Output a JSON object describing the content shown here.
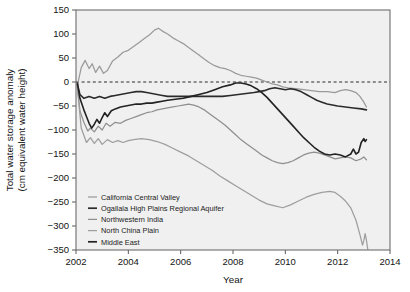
{
  "chart_data": {
    "type": "line",
    "title": "",
    "xlabel": "Year",
    "ylabel": "Total water storage anomaly\n(cm equivalent water height)",
    "ylabel_line1": "Total water storage anomaly",
    "ylabel_line2": "(cm equivalent water height)",
    "xlim": [
      2002,
      2014
    ],
    "ylim": [
      -350,
      150
    ],
    "xticks": [
      2002,
      2004,
      2006,
      2008,
      2010,
      2012,
      2014
    ],
    "yticks": [
      150,
      100,
      50,
      0,
      -50,
      -100,
      -150,
      -200,
      -250,
      -300,
      -350
    ],
    "xtick_labels": [
      "2002",
      "2004",
      "2006",
      "2008",
      "2010",
      "2012",
      "2014"
    ],
    "ytick_labels": [
      "150",
      "100",
      "50",
      "0",
      "-50",
      "-100",
      "-150",
      "-200",
      "-250",
      "-300",
      "-350"
    ],
    "grid": false,
    "plot_background": "#f0f0f0",
    "reference_line": {
      "value": 0,
      "style": "dashed",
      "color": "#2a2a2a"
    },
    "legend_position": "lower-left-inside",
    "series": [
      {
        "name": "California Central Valley",
        "color": "#9a9a9a",
        "width": 1.25,
        "points": [
          [
            2002.05,
            -8
          ],
          [
            2002.2,
            30
          ],
          [
            2002.35,
            45
          ],
          [
            2002.5,
            28
          ],
          [
            2002.62,
            38
          ],
          [
            2002.75,
            20
          ],
          [
            2002.9,
            33
          ],
          [
            2003.05,
            18
          ],
          [
            2003.2,
            24
          ],
          [
            2003.4,
            44
          ],
          [
            2003.6,
            52
          ],
          [
            2003.8,
            62
          ],
          [
            2004.0,
            66
          ],
          [
            2004.2,
            74
          ],
          [
            2004.4,
            82
          ],
          [
            2004.6,
            90
          ],
          [
            2004.8,
            98
          ],
          [
            2005.0,
            108
          ],
          [
            2005.15,
            112
          ],
          [
            2005.3,
            106
          ],
          [
            2005.5,
            100
          ],
          [
            2005.7,
            92
          ],
          [
            2005.9,
            86
          ],
          [
            2006.1,
            80
          ],
          [
            2006.3,
            72
          ],
          [
            2006.5,
            64
          ],
          [
            2006.7,
            56
          ],
          [
            2006.9,
            48
          ],
          [
            2007.1,
            40
          ],
          [
            2007.3,
            34
          ],
          [
            2007.5,
            30
          ],
          [
            2007.7,
            28
          ],
          [
            2007.9,
            24
          ],
          [
            2008.1,
            18
          ],
          [
            2008.3,
            14
          ],
          [
            2008.5,
            12
          ],
          [
            2008.7,
            10
          ],
          [
            2008.9,
            8
          ],
          [
            2009.1,
            4
          ],
          [
            2009.3,
            0
          ],
          [
            2009.5,
            -4
          ],
          [
            2009.7,
            -6
          ],
          [
            2009.9,
            -10
          ],
          [
            2010.1,
            -12
          ],
          [
            2010.4,
            -14
          ],
          [
            2010.7,
            -16
          ],
          [
            2011.0,
            -18
          ],
          [
            2011.3,
            -20
          ],
          [
            2011.6,
            -20
          ],
          [
            2011.9,
            -22
          ],
          [
            2012.1,
            -18
          ],
          [
            2012.3,
            -16
          ],
          [
            2012.5,
            -18
          ],
          [
            2012.7,
            -22
          ],
          [
            2012.85,
            -30
          ],
          [
            2013.0,
            -42
          ],
          [
            2013.1,
            -52
          ]
        ]
      },
      {
        "name": "Ogallala High Plains Regional Aquifer",
        "color": "#2b2b2b",
        "width": 1.6,
        "points": [
          [
            2002.05,
            -4
          ],
          [
            2002.15,
            -26
          ],
          [
            2002.3,
            -34
          ],
          [
            2002.5,
            -30
          ],
          [
            2002.7,
            -34
          ],
          [
            2002.9,
            -30
          ],
          [
            2003.1,
            -34
          ],
          [
            2003.3,
            -30
          ],
          [
            2003.5,
            -28
          ],
          [
            2003.7,
            -26
          ],
          [
            2003.9,
            -24
          ],
          [
            2004.1,
            -22
          ],
          [
            2004.3,
            -20
          ],
          [
            2004.5,
            -20
          ],
          [
            2004.7,
            -22
          ],
          [
            2004.9,
            -24
          ],
          [
            2005.1,
            -26
          ],
          [
            2005.3,
            -28
          ],
          [
            2005.5,
            -30
          ],
          [
            2005.8,
            -30
          ],
          [
            2006.1,
            -30
          ],
          [
            2006.4,
            -30
          ],
          [
            2006.7,
            -30
          ],
          [
            2007.0,
            -30
          ],
          [
            2007.3,
            -30
          ],
          [
            2007.6,
            -30
          ],
          [
            2007.9,
            -28
          ],
          [
            2008.2,
            -26
          ],
          [
            2008.5,
            -24
          ],
          [
            2008.8,
            -22
          ],
          [
            2009.0,
            -20
          ],
          [
            2009.2,
            -18
          ],
          [
            2009.4,
            -14
          ],
          [
            2009.6,
            -12
          ],
          [
            2009.8,
            -14
          ],
          [
            2010.0,
            -16
          ],
          [
            2010.2,
            -14
          ],
          [
            2010.4,
            -16
          ],
          [
            2010.6,
            -20
          ],
          [
            2010.8,
            -26
          ],
          [
            2011.0,
            -32
          ],
          [
            2011.2,
            -38
          ],
          [
            2011.4,
            -42
          ],
          [
            2011.6,
            -46
          ],
          [
            2011.8,
            -48
          ],
          [
            2012.0,
            -50
          ],
          [
            2012.3,
            -52
          ],
          [
            2012.6,
            -54
          ],
          [
            2012.9,
            -56
          ],
          [
            2013.1,
            -58
          ]
        ]
      },
      {
        "name": "Northwestern India",
        "color": "#8f8f8f",
        "width": 1.25,
        "points": [
          [
            2002.05,
            -6
          ],
          [
            2002.15,
            -60
          ],
          [
            2002.3,
            -84
          ],
          [
            2002.45,
            -102
          ],
          [
            2002.55,
            -96
          ],
          [
            2002.7,
            -104
          ],
          [
            2002.85,
            -92
          ],
          [
            2003.0,
            -100
          ],
          [
            2003.15,
            -86
          ],
          [
            2003.3,
            -92
          ],
          [
            2003.5,
            -84
          ],
          [
            2003.7,
            -86
          ],
          [
            2003.9,
            -80
          ],
          [
            2004.1,
            -76
          ],
          [
            2004.3,
            -72
          ],
          [
            2004.5,
            -68
          ],
          [
            2004.7,
            -64
          ],
          [
            2004.9,
            -62
          ],
          [
            2005.1,
            -58
          ],
          [
            2005.3,
            -56
          ],
          [
            2005.5,
            -54
          ],
          [
            2005.7,
            -52
          ],
          [
            2005.9,
            -50
          ],
          [
            2006.1,
            -48
          ],
          [
            2006.3,
            -46
          ],
          [
            2006.5,
            -48
          ],
          [
            2006.7,
            -52
          ],
          [
            2006.9,
            -58
          ],
          [
            2007.1,
            -66
          ],
          [
            2007.3,
            -74
          ],
          [
            2007.5,
            -82
          ],
          [
            2007.7,
            -90
          ],
          [
            2007.9,
            -100
          ],
          [
            2008.1,
            -110
          ],
          [
            2008.3,
            -120
          ],
          [
            2008.5,
            -128
          ],
          [
            2008.7,
            -136
          ],
          [
            2008.9,
            -144
          ],
          [
            2009.1,
            -152
          ],
          [
            2009.3,
            -158
          ],
          [
            2009.5,
            -164
          ],
          [
            2009.7,
            -168
          ],
          [
            2009.9,
            -170
          ],
          [
            2010.1,
            -168
          ],
          [
            2010.3,
            -164
          ],
          [
            2010.5,
            -158
          ],
          [
            2010.7,
            -152
          ],
          [
            2010.9,
            -148
          ],
          [
            2011.1,
            -146
          ],
          [
            2011.3,
            -148
          ],
          [
            2011.5,
            -152
          ],
          [
            2011.7,
            -156
          ],
          [
            2011.9,
            -160
          ],
          [
            2012.1,
            -158
          ],
          [
            2012.3,
            -156
          ],
          [
            2012.5,
            -158
          ],
          [
            2012.7,
            -164
          ],
          [
            2012.9,
            -160
          ],
          [
            2013.0,
            -156
          ],
          [
            2013.1,
            -162
          ]
        ]
      },
      {
        "name": "North China Plain",
        "color": "#9e9e9e",
        "width": 1.25,
        "points": [
          [
            2002.05,
            -10
          ],
          [
            2002.2,
            -96
          ],
          [
            2002.4,
            -126
          ],
          [
            2002.55,
            -116
          ],
          [
            2002.7,
            -128
          ],
          [
            2002.85,
            -118
          ],
          [
            2003.0,
            -130
          ],
          [
            2003.2,
            -120
          ],
          [
            2003.4,
            -126
          ],
          [
            2003.6,
            -122
          ],
          [
            2003.8,
            -126
          ],
          [
            2004.0,
            -122
          ],
          [
            2004.2,
            -120
          ],
          [
            2004.5,
            -118
          ],
          [
            2004.8,
            -120
          ],
          [
            2005.1,
            -124
          ],
          [
            2005.4,
            -130
          ],
          [
            2005.7,
            -138
          ],
          [
            2006.0,
            -146
          ],
          [
            2006.3,
            -154
          ],
          [
            2006.6,
            -164
          ],
          [
            2006.9,
            -174
          ],
          [
            2007.2,
            -184
          ],
          [
            2007.5,
            -196
          ],
          [
            2007.8,
            -206
          ],
          [
            2008.1,
            -216
          ],
          [
            2008.4,
            -226
          ],
          [
            2008.7,
            -236
          ],
          [
            2009.0,
            -246
          ],
          [
            2009.3,
            -254
          ],
          [
            2009.6,
            -258
          ],
          [
            2009.9,
            -262
          ],
          [
            2010.2,
            -256
          ],
          [
            2010.5,
            -248
          ],
          [
            2010.8,
            -240
          ],
          [
            2011.1,
            -234
          ],
          [
            2011.4,
            -230
          ],
          [
            2011.7,
            -228
          ],
          [
            2011.9,
            -230
          ],
          [
            2012.1,
            -238
          ],
          [
            2012.3,
            -248
          ],
          [
            2012.5,
            -262
          ],
          [
            2012.7,
            -288
          ],
          [
            2012.85,
            -318
          ],
          [
            2012.95,
            -340
          ],
          [
            2013.0,
            -330
          ],
          [
            2013.05,
            -316
          ],
          [
            2013.1,
            -330
          ],
          [
            2013.15,
            -348
          ]
        ]
      },
      {
        "name": "Middle East",
        "color": "#222222",
        "width": 1.6,
        "points": [
          [
            2002.05,
            -2
          ],
          [
            2002.15,
            -34
          ],
          [
            2002.3,
            -58
          ],
          [
            2002.4,
            -72
          ],
          [
            2002.5,
            -86
          ],
          [
            2002.6,
            -96
          ],
          [
            2002.7,
            -88
          ],
          [
            2002.8,
            -78
          ],
          [
            2002.9,
            -86
          ],
          [
            2003.0,
            -74
          ],
          [
            2003.1,
            -64
          ],
          [
            2003.2,
            -72
          ],
          [
            2003.35,
            -60
          ],
          [
            2003.5,
            -56
          ],
          [
            2003.7,
            -52
          ],
          [
            2003.9,
            -50
          ],
          [
            2004.1,
            -48
          ],
          [
            2004.3,
            -46
          ],
          [
            2004.5,
            -46
          ],
          [
            2004.7,
            -44
          ],
          [
            2004.9,
            -44
          ],
          [
            2005.1,
            -42
          ],
          [
            2005.3,
            -40
          ],
          [
            2005.5,
            -38
          ],
          [
            2005.8,
            -36
          ],
          [
            2006.1,
            -34
          ],
          [
            2006.4,
            -30
          ],
          [
            2006.7,
            -26
          ],
          [
            2007.0,
            -22
          ],
          [
            2007.3,
            -16
          ],
          [
            2007.6,
            -10
          ],
          [
            2007.9,
            -6
          ],
          [
            2008.1,
            -2
          ],
          [
            2008.3,
            -2
          ],
          [
            2008.5,
            -4
          ],
          [
            2008.7,
            -8
          ],
          [
            2008.9,
            -14
          ],
          [
            2009.1,
            -22
          ],
          [
            2009.3,
            -32
          ],
          [
            2009.5,
            -44
          ],
          [
            2009.7,
            -56
          ],
          [
            2009.9,
            -68
          ],
          [
            2010.1,
            -80
          ],
          [
            2010.3,
            -92
          ],
          [
            2010.5,
            -104
          ],
          [
            2010.7,
            -116
          ],
          [
            2010.9,
            -126
          ],
          [
            2011.1,
            -136
          ],
          [
            2011.3,
            -144
          ],
          [
            2011.5,
            -150
          ],
          [
            2011.7,
            -152
          ],
          [
            2011.9,
            -150
          ],
          [
            2012.1,
            -152
          ],
          [
            2012.3,
            -156
          ],
          [
            2012.5,
            -150
          ],
          [
            2012.6,
            -140
          ],
          [
            2012.7,
            -150
          ],
          [
            2012.8,
            -146
          ],
          [
            2012.9,
            -126
          ],
          [
            2013.0,
            -118
          ],
          [
            2013.05,
            -124
          ],
          [
            2013.1,
            -120
          ]
        ]
      }
    ],
    "legend": [
      {
        "label": "California Central Valley",
        "color": "#9a9a9a",
        "width": 1.25
      },
      {
        "label": "Ogallala High Plains Regional Aquifer",
        "color": "#2b2b2b",
        "width": 1.7
      },
      {
        "label": "Northwestern India",
        "color": "#8f8f8f",
        "width": 1.25
      },
      {
        "label": "North China Plain",
        "color": "#9e9e9e",
        "width": 1.25
      },
      {
        "label": "Middle East",
        "color": "#222222",
        "width": 1.7
      }
    ]
  }
}
